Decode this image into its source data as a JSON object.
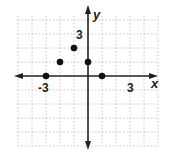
{
  "chart_data": {
    "type": "scatter",
    "title": "",
    "xlabel": "x",
    "ylabel": "y",
    "xlim": [
      -5,
      5
    ],
    "ylim": [
      -4,
      4
    ],
    "grid": true,
    "tick_labels": {
      "x": [
        "-3",
        "3"
      ],
      "y": [
        "3"
      ]
    },
    "points": [
      {
        "x": -3,
        "y": 0
      },
      {
        "x": -2,
        "y": 1
      },
      {
        "x": -1,
        "y": 2
      },
      {
        "x": 0,
        "y": 1
      },
      {
        "x": 1,
        "y": 0
      }
    ]
  },
  "labels": {
    "x_axis": "x",
    "y_axis": "y",
    "x_neg3": "-3",
    "x_pos3": "3",
    "y_pos3": "3"
  },
  "colors": {
    "axis": "#222222",
    "grid": "#b8b8b8",
    "point": "#111111"
  }
}
